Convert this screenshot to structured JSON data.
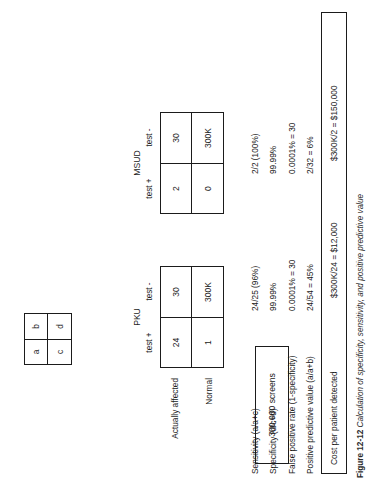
{
  "figure": {
    "screens_box": "300,000 screens",
    "legend": {
      "a": "a",
      "b": "b",
      "c": "c",
      "d": "d"
    },
    "row_labels": {
      "affected": "Actually affected",
      "normal": "Normal"
    },
    "col_headers": {
      "positive": "test +",
      "negative": "test -"
    },
    "tables": [
      {
        "title": "PKU",
        "cells": {
          "a": "24",
          "b": "30",
          "c": "1",
          "d": "300K"
        }
      },
      {
        "title": "MSUD",
        "cells": {
          "a": "2",
          "b": "30",
          "c": "0",
          "d": "300K"
        }
      }
    ],
    "metrics": [
      {
        "label": "Sensitivity (a/a+c)",
        "pku": "24/25 (96%)",
        "msud": "2/2 (100%)"
      },
      {
        "label": "Specificity (d/c+d)",
        "pku": "99.99%",
        "msud": "99.99%"
      },
      {
        "label": "False positive rate (1-specificity)",
        "pku": "0.0001% = 30",
        "msud": "0.0001% = 30"
      },
      {
        "label": "Positive predictive value (a/a+b)",
        "pku": "24/54 = 45%",
        "msud": "2/32 = 6%"
      }
    ],
    "cost": {
      "label": "Cost per patient detected",
      "pku": "$300K/24 = $12,000",
      "msud": "$300K/2 = $150,000"
    },
    "caption": {
      "number": "Figure 12-12",
      "text": "Calculation of specificity, sensitivity, and positive predictive value"
    }
  }
}
